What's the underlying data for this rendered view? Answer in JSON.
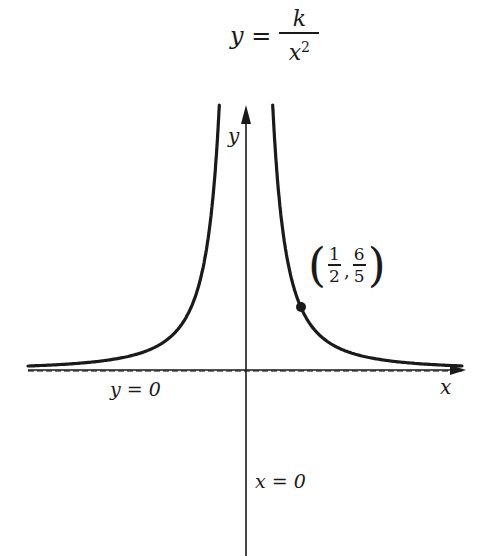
{
  "title": {
    "lhs": "y =",
    "numerator": "k",
    "denominator_base": "x",
    "denominator_exp": "2"
  },
  "axes": {
    "x_label": "x",
    "y_label": "y",
    "horizontal_asymptote_label": "y = 0",
    "vertical_asymptote_label": "x = 0"
  },
  "point": {
    "x_num": "1",
    "x_den": "2",
    "y_num": "6",
    "y_den": "5",
    "separator": ","
  },
  "colors": {
    "curve": "#1a1a1a",
    "axis": "#1a1a1a",
    "asymptote": "#555555",
    "background": "#ffffff"
  },
  "chart_data": {
    "type": "line",
    "function": "y = k / x^2",
    "k": 0.3,
    "xlabel": "x",
    "ylabel": "y",
    "asymptotes": [
      "y = 0",
      "x = 0"
    ],
    "marked_point": {
      "x": 0.5,
      "y": 1.2,
      "label": "(1/2, 6/5)"
    },
    "xlim": [
      -2.2,
      2.0
    ],
    "ylim": [
      -3.5,
      5.0
    ],
    "grid": false,
    "legend": "none"
  }
}
